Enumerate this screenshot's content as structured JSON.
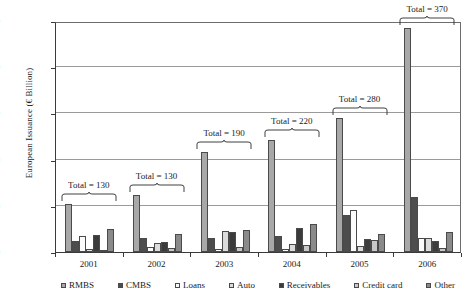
{
  "chart_data": {
    "type": "bar",
    "title": "",
    "xlabel": "",
    "ylabel": "European Issuance (€ Billion)",
    "ylim": [
      0,
      250
    ],
    "ytick_labels": [
      "0",
      "50",
      "100",
      "150",
      "200",
      "250"
    ],
    "ytick_values": [
      0,
      50,
      100,
      150,
      200,
      250
    ],
    "grid": true,
    "legend_position": "bottom",
    "categories": [
      "2001",
      "2002",
      "2003",
      "2004",
      "2005",
      "2006"
    ],
    "series": [
      {
        "name": "RMBS",
        "color": "#a8a8a8",
        "values": [
          52,
          62,
          108,
          121,
          145,
          242
        ]
      },
      {
        "name": "CMBS",
        "color": "#4d4d4d",
        "values": [
          12,
          15,
          15,
          17,
          40,
          60
        ]
      },
      {
        "name": "Loans",
        "color": "#fbfbfb",
        "values": [
          17,
          5,
          3,
          3,
          45,
          15
        ]
      },
      {
        "name": "Auto",
        "color": "#dcdcdc",
        "values": [
          3,
          10,
          23,
          9,
          7,
          15
        ]
      },
      {
        "name": "Receivables",
        "color": "#3b3b3b",
        "values": [
          18,
          11,
          22,
          26,
          14,
          12
        ]
      },
      {
        "name": "Credit card",
        "color": "#c9c9c9",
        "values": [
          1,
          4,
          5,
          8,
          13,
          4
        ]
      },
      {
        "name": "Other",
        "color": "#8a8a8a",
        "values": [
          25,
          20,
          24,
          30,
          20,
          22
        ]
      }
    ],
    "annotations": [
      {
        "label": "Total = 130",
        "category": "2001"
      },
      {
        "label": "Total = 130",
        "category": "2002"
      },
      {
        "label": "Total = 190",
        "category": "2003"
      },
      {
        "label": "Total = 220",
        "category": "2004"
      },
      {
        "label": "Total = 280",
        "category": "2005"
      },
      {
        "label": "Total = 370",
        "category": "2006"
      }
    ]
  }
}
